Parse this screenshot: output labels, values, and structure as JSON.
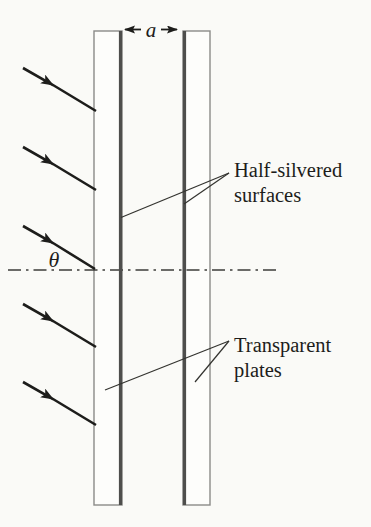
{
  "figure": {
    "labels": {
      "gap_dimension": "a",
      "incidence_angle": "θ",
      "half_silvered_line1": "Half-silvered",
      "half_silvered_line2": "surfaces",
      "transparent_line1": "Transparent",
      "transparent_line2": "plates"
    },
    "colors": {
      "background": "#fafaf7",
      "ink": "#1d1d1b",
      "plate_outline": "#8a8a88",
      "silvered_surface": "#4e4e4c",
      "axis": "#3c3c3a",
      "leader_line": "#33332f"
    },
    "incident_ray_count": 5
  }
}
